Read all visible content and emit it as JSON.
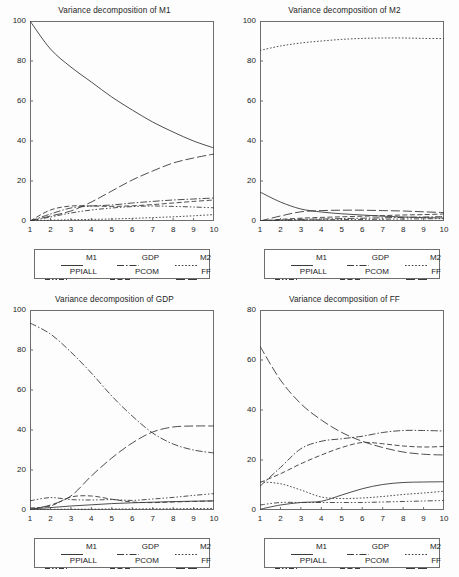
{
  "figure": {
    "panel_count": 4,
    "background": "#fdfdfd",
    "line_color": "#3a3a3a"
  },
  "legend": {
    "entries": [
      {
        "label": "M1",
        "style": "solid",
        "dash": "none"
      },
      {
        "label": "GDP",
        "style": "dash-dot",
        "dash": "7,2,1.5,2"
      },
      {
        "label": "M2",
        "style": "dotted",
        "dash": "1.6,1.8"
      },
      {
        "label": "PPIALL",
        "style": "dash-dot-dot",
        "dash": "5,2,1.5,2,1.5,2"
      },
      {
        "label": "PCOM",
        "style": "dashed",
        "dash": "5,2.5"
      },
      {
        "label": "FF",
        "style": "long-dash",
        "dash": "9,3"
      }
    ]
  },
  "chart_data": [
    {
      "type": "line",
      "title": "Variance decomposition of M1",
      "xlabel": "",
      "ylabel": "",
      "x": [
        1,
        2,
        3,
        4,
        5,
        6,
        7,
        8,
        9,
        10
      ],
      "xticks": [
        "1",
        "2",
        "3",
        "4",
        "5",
        "6",
        "7",
        "8",
        "9",
        "10"
      ],
      "yticks": [
        0,
        20,
        40,
        60,
        80,
        100
      ],
      "xlim": [
        1,
        10
      ],
      "ylim": [
        0,
        100
      ],
      "grid": false,
      "legend_position": "below",
      "series": [
        {
          "name": "M1",
          "values": [
            100.0,
            86.0,
            77.0,
            69.5,
            62.0,
            55.5,
            49.5,
            44.5,
            40.0,
            36.5
          ]
        },
        {
          "name": "GDP",
          "values": [
            0.0,
            3.5,
            6.5,
            7.5,
            8.0,
            9.0,
            9.8,
            10.5,
            11.0,
            11.5
          ]
        },
        {
          "name": "M2",
          "values": [
            0.0,
            0.4,
            0.6,
            0.8,
            1.0,
            1.3,
            1.7,
            2.1,
            2.6,
            3.2
          ]
        },
        {
          "name": "PPIALL",
          "values": [
            0.0,
            2.0,
            4.0,
            5.5,
            6.5,
            7.2,
            7.5,
            7.3,
            7.0,
            6.6
          ]
        },
        {
          "name": "PCOM",
          "values": [
            0.0,
            5.5,
            7.5,
            7.5,
            7.3,
            7.6,
            8.2,
            9.0,
            9.8,
            10.5
          ]
        },
        {
          "name": "FF",
          "values": [
            0.0,
            2.5,
            5.0,
            9.5,
            15.0,
            20.5,
            25.0,
            29.0,
            31.5,
            33.5
          ]
        }
      ]
    },
    {
      "type": "line",
      "title": "Variance decomposition of M2",
      "xlabel": "",
      "ylabel": "",
      "x": [
        1,
        2,
        3,
        4,
        5,
        6,
        7,
        8,
        9,
        10
      ],
      "xticks": [
        "1",
        "2",
        "3",
        "4",
        "5",
        "6",
        "7",
        "8",
        "9",
        "10"
      ],
      "yticks": [
        0,
        20,
        40,
        60,
        80,
        100
      ],
      "xlim": [
        1,
        10
      ],
      "ylim": [
        0,
        100
      ],
      "grid": false,
      "legend_position": "below",
      "series": [
        {
          "name": "M1",
          "values": [
            14.5,
            9.5,
            6.0,
            4.5,
            3.6,
            3.0,
            2.4,
            2.0,
            1.7,
            1.5
          ]
        },
        {
          "name": "GDP",
          "values": [
            0.2,
            0.5,
            0.8,
            1.0,
            1.2,
            1.4,
            1.6,
            1.8,
            2.0,
            2.2
          ]
        },
        {
          "name": "M2",
          "values": [
            85.3,
            87.5,
            89.0,
            90.0,
            90.8,
            91.3,
            91.5,
            91.5,
            91.3,
            91.2
          ]
        },
        {
          "name": "PPIALL",
          "values": [
            0.0,
            0.3,
            0.5,
            0.6,
            0.7,
            0.8,
            0.9,
            1.0,
            1.1,
            1.2
          ]
        },
        {
          "name": "PCOM",
          "values": [
            0.0,
            0.8,
            1.4,
            1.8,
            2.1,
            2.4,
            2.7,
            3.0,
            3.2,
            3.5
          ]
        },
        {
          "name": "FF",
          "values": [
            0.0,
            2.5,
            4.6,
            5.2,
            5.4,
            5.4,
            5.2,
            5.0,
            4.6,
            4.2
          ]
        }
      ]
    },
    {
      "type": "line",
      "title": "Variance decomposition of GDP",
      "xlabel": "",
      "ylabel": "",
      "x": [
        1,
        2,
        3,
        4,
        5,
        6,
        7,
        8,
        9,
        10
      ],
      "xticks": [
        "1",
        "2",
        "3",
        "4",
        "5",
        "6",
        "7",
        "8",
        "9",
        "10"
      ],
      "yticks": [
        0,
        20,
        40,
        60,
        80,
        100
      ],
      "xlim": [
        1,
        10
      ],
      "ylim": [
        0,
        100
      ],
      "grid": false,
      "legend_position": "below",
      "series": [
        {
          "name": "M1",
          "values": [
            0.5,
            1.2,
            2.0,
            2.6,
            3.2,
            3.6,
            3.9,
            4.2,
            4.4,
            4.6
          ]
        },
        {
          "name": "GDP",
          "values": [
            93.5,
            88.0,
            79.0,
            68.5,
            57.0,
            47.0,
            38.5,
            33.0,
            30.0,
            28.5
          ]
        },
        {
          "name": "M2",
          "values": [
            0.2,
            0.3,
            0.4,
            0.4,
            0.5,
            0.5,
            0.6,
            0.6,
            0.7,
            0.7
          ]
        },
        {
          "name": "PPIALL",
          "values": [
            4.6,
            6.2,
            5.2,
            5.0,
            5.2,
            4.8,
            5.5,
            6.3,
            7.3,
            8.2
          ]
        },
        {
          "name": "PCOM",
          "values": [
            1.0,
            2.0,
            6.5,
            7.0,
            5.4,
            4.0,
            3.7,
            4.0,
            4.3,
            4.5
          ]
        },
        {
          "name": "FF",
          "values": [
            0.3,
            2.5,
            7.0,
            17.0,
            26.0,
            33.5,
            39.0,
            41.5,
            42.0,
            42.0
          ]
        }
      ]
    },
    {
      "type": "line",
      "title": "Variance decomposition of FF",
      "xlabel": "",
      "ylabel": "",
      "x": [
        1,
        2,
        3,
        4,
        5,
        6,
        7,
        8,
        9,
        10
      ],
      "xticks": [
        "1",
        "2",
        "3",
        "4",
        "5",
        "6",
        "7",
        "8",
        "9",
        "10"
      ],
      "yticks": [
        0,
        20,
        40,
        60,
        80
      ],
      "xlim": [
        1,
        10
      ],
      "ylim": [
        0,
        80
      ],
      "grid": false,
      "legend_position": "below",
      "series": [
        {
          "name": "M1",
          "values": [
            0.3,
            2.0,
            3.0,
            3.5,
            6.0,
            8.5,
            10.2,
            11.0,
            11.2,
            11.3
          ]
        },
        {
          "name": "GDP",
          "values": [
            9.5,
            17.0,
            24.5,
            27.5,
            28.5,
            29.5,
            31.0,
            31.8,
            31.8,
            31.6
          ]
        },
        {
          "name": "M2",
          "values": [
            11.3,
            10.5,
            8.0,
            5.2,
            4.6,
            4.8,
            5.4,
            6.2,
            6.8,
            7.5
          ]
        },
        {
          "name": "PPIALL",
          "values": [
            2.0,
            3.0,
            3.0,
            3.0,
            3.0,
            3.0,
            3.2,
            3.4,
            3.6,
            3.8
          ]
        },
        {
          "name": "PCOM",
          "values": [
            11.0,
            14.5,
            18.5,
            22.0,
            25.0,
            27.0,
            26.5,
            25.6,
            25.2,
            25.4
          ]
        },
        {
          "name": "FF",
          "values": [
            65.5,
            52.0,
            42.5,
            36.0,
            31.0,
            27.5,
            25.0,
            23.2,
            22.3,
            22.0
          ]
        }
      ]
    }
  ]
}
